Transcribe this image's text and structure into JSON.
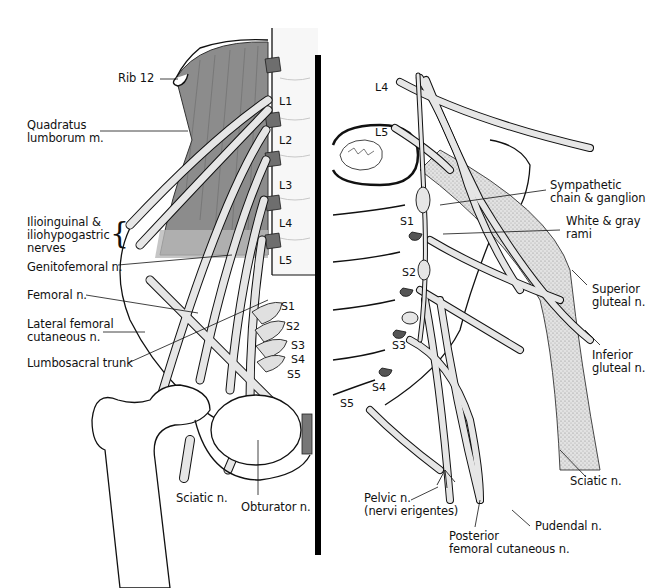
{
  "figure": {
    "type": "anatomical-illustration",
    "colors": {
      "muscle": "#8c8c8c",
      "nerve": "#e6e6e6",
      "nerve_stipple": "#bdbdbd",
      "outline": "#111111",
      "divider": "#000000",
      "disc": "#6e6e6e"
    }
  },
  "left_panel": {
    "view": "anterior",
    "labels": {
      "rib12": "Rib 12",
      "quadratus_1": "Quadratus",
      "quadratus_2": "lumborum m.",
      "ilio_1": "Ilioinguinal &",
      "ilio_2": "iliohypogastric",
      "ilio_3": "nerves",
      "genitofemoral": "Genitofemoral n.",
      "femoral": "Femoral n.",
      "latfem_1": "Lateral femoral",
      "latfem_2": "cutaneous n.",
      "lumbosacral": "Lumbosacral trunk",
      "sciatic": "Sciatic n.",
      "obturator": "Obturator n."
    },
    "levels": [
      "L1",
      "L2",
      "L3",
      "L4",
      "L5",
      "S1",
      "S2",
      "S3",
      "S4",
      "S5"
    ]
  },
  "right_panel": {
    "view": "sacral",
    "labels": {
      "symp_1": "Sympathetic",
      "symp_2": "chain & ganglion",
      "rami_1": "White & gray",
      "rami_2": "rami",
      "supglut_1": "Superior",
      "supglut_2": "gluteal n.",
      "infglut_1": "Inferior",
      "infglut_2": "gluteal n.",
      "sciatic": "Sciatic n.",
      "pudendal": "Pudendal n.",
      "postfem_1": "Posterior",
      "postfem_2": "femoral cutaneous n.",
      "pelvic_1": "Pelvic n.",
      "pelvic_2": "(nervi erigentes)"
    },
    "levels": [
      "L4",
      "L5",
      "S1",
      "S2",
      "S3",
      "S4",
      "S5"
    ]
  }
}
